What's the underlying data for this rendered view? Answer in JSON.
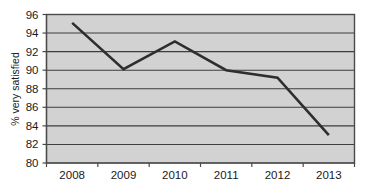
{
  "chart_data": {
    "type": "line",
    "title": "",
    "subtitle": "",
    "xlabel": "",
    "ylabel": "% very satisfied",
    "categories": [
      "2008",
      "2009",
      "2010",
      "2011",
      "2012",
      "2013"
    ],
    "values": [
      95.1,
      90.1,
      93.1,
      90.0,
      89.2,
      83.0
    ],
    "series": [
      {
        "name": "% very satisfied",
        "values": [
          95.1,
          90.1,
          93.1,
          90.0,
          89.2,
          83.0
        ]
      }
    ],
    "ylim": [
      80,
      96
    ],
    "ytick_labels": [
      "80",
      "82",
      "84",
      "86",
      "88",
      "90",
      "92",
      "94",
      "96"
    ],
    "ytick_values": [
      80,
      82,
      84,
      86,
      88,
      90,
      92,
      94,
      96
    ],
    "xtick_labels": [
      "2008",
      "2009",
      "2010",
      "2011",
      "2012",
      "2013"
    ],
    "grid": "horizontal",
    "legend": "none",
    "markers": "none",
    "colors": {
      "plot_background": "#d2d2d2",
      "page_background": "#ffffff",
      "gridline": "#3d3d3d",
      "line": "#2e2e2e",
      "axis": "#4a4a4a",
      "text": "#1a1a1a"
    }
  }
}
